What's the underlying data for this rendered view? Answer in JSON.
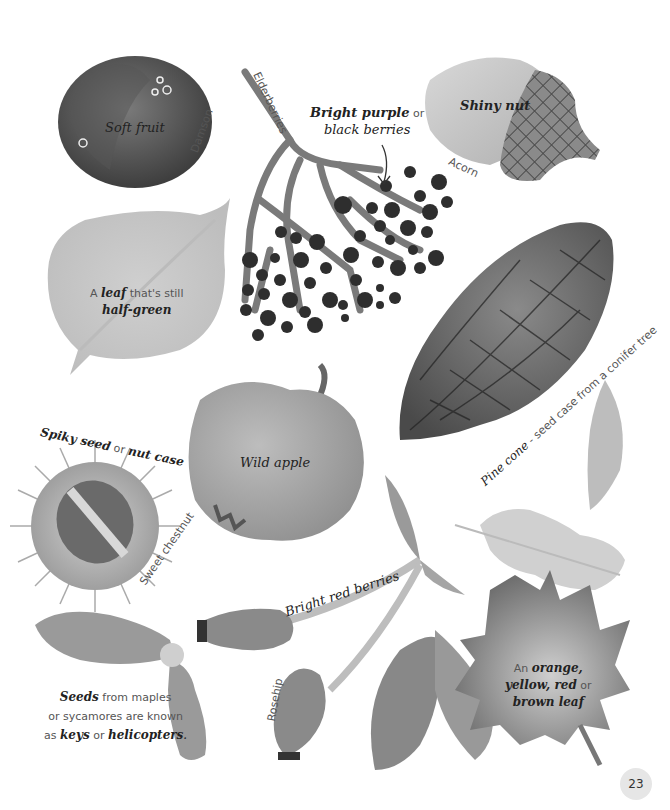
{
  "page": {
    "number": "23"
  },
  "items": {
    "damson": {
      "name": "Damson",
      "caption": "Soft fruit"
    },
    "elderberries": {
      "name": "Elderberries",
      "caption_line1_strong": "Bright purple",
      "caption_line1_rest": " or",
      "caption_line2": "black berries"
    },
    "acorn": {
      "name": "Acorn",
      "caption": "Shiny nut"
    },
    "half_green_leaf": {
      "caption_prefix": "A ",
      "caption_strong": "leaf",
      "caption_suffix": " that's still",
      "caption_line2": "half-green"
    },
    "pine_cone": {
      "name": "Pine cone",
      "caption": " - seed case from a conifer tree"
    },
    "sweet_chestnut": {
      "name": "Sweet chestnut",
      "caption_strong1": "Spiky seed",
      "caption_mid": " or ",
      "caption_strong2": "nut case"
    },
    "wild_apple": {
      "caption": "Wild apple"
    },
    "rowan": {
      "caption": "Bright red berries"
    },
    "rosehip": {
      "name": "Rosehip"
    },
    "maple_seeds": {
      "line1_strong": "Seeds",
      "line1_rest": " from maples",
      "line2": "or sycamores are known",
      "line3_prefix": "as ",
      "line3_strong1": "keys",
      "line3_mid": " or ",
      "line3_strong2": "helicopters",
      "line3_suffix": "."
    },
    "autumn_leaf": {
      "line1_prefix": "An ",
      "line1_strong": "orange,",
      "line2_strong": "yellow, red",
      "line2_rest": " or",
      "line3": "brown leaf"
    }
  }
}
